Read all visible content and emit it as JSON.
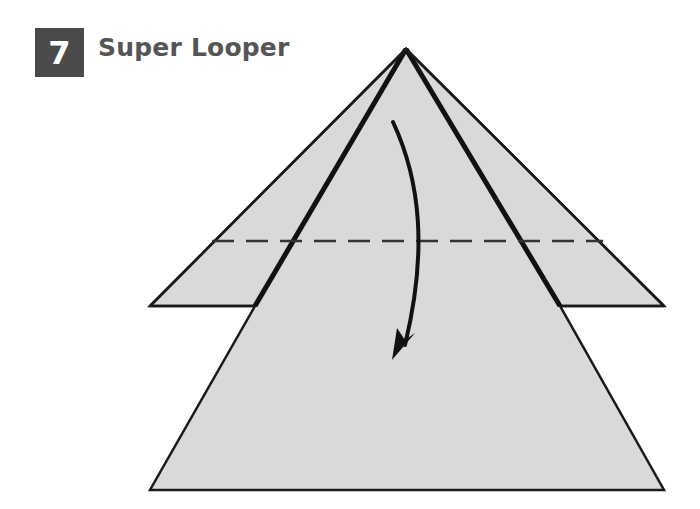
{
  "header": {
    "step_number": "7",
    "title": "Super Looper"
  },
  "diagram": {
    "paper_fill": "#d9d9d9",
    "line_color": "#1a1a1a",
    "fold_line": "dashed horizontal valley fold",
    "arrow": "curved arrow pointing down indicating fold direction"
  }
}
